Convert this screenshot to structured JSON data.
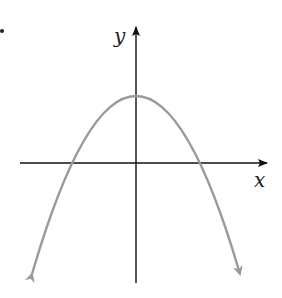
{
  "diagram": {
    "type": "graph-of-function",
    "axes": {
      "x_label": "x",
      "y_label": "y"
    },
    "curve": {
      "shape": "parabola",
      "opens": "down",
      "color": "#999999"
    },
    "colors": {
      "axis": "#111111",
      "curve": "#9a9a9a"
    }
  }
}
